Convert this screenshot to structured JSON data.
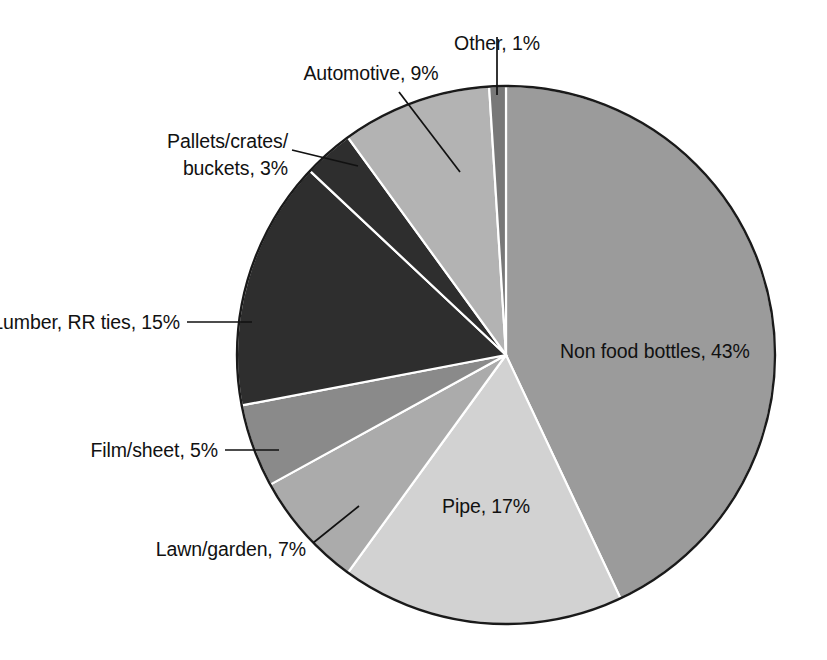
{
  "chart_data": {
    "type": "pie",
    "title": "",
    "subtitle": "",
    "xlabel": "",
    "ylabel": "",
    "units": "percent",
    "total": 100,
    "legend_position": "none",
    "label_format": "{name}, {value}%",
    "grid": false,
    "start_angle_deg": -90,
    "direction": "clockwise",
    "categories": [
      "Non food bottles",
      "Pipe",
      "Lawn/garden",
      "Film/sheet",
      "Lumber, RR ties",
      "Pallets/crates/buckets",
      "Automotive",
      "Other"
    ],
    "values": [
      43,
      17,
      7,
      5,
      15,
      3,
      9,
      1
    ],
    "colors": [
      "#9b9b9b",
      "#d2d2d2",
      "#ababab",
      "#8a8a8a",
      "#2e2e2e",
      "#2e2e2e",
      "#b3b3b3",
      "#787878"
    ],
    "slices": [
      {
        "name": "Non food bottles",
        "value": 43,
        "label": "Non food bottles, 43%",
        "color": "#9b9b9b",
        "label_placement": "inside"
      },
      {
        "name": "Pipe",
        "value": 17,
        "label": "Pipe, 17%",
        "color": "#d2d2d2",
        "label_placement": "inside"
      },
      {
        "name": "Lawn/garden",
        "value": 7,
        "label": "Lawn/garden, 7%",
        "color": "#ababab",
        "label_placement": "outside-left"
      },
      {
        "name": "Film/sheet",
        "value": 5,
        "label": "Film/sheet, 5%",
        "color": "#8a8a8a",
        "label_placement": "outside-left"
      },
      {
        "name": "Lumber, RR ties",
        "value": 15,
        "label": "Lumber, RR ties, 15%",
        "color": "#2e2e2e",
        "label_placement": "outside-left"
      },
      {
        "name": "Pallets/crates/buckets",
        "value": 3,
        "label": "Pallets/crates/\nbuckets, 3%",
        "label_line1": "Pallets/crates/",
        "label_line2": "buckets, 3%",
        "color": "#2e2e2e",
        "label_placement": "outside-left"
      },
      {
        "name": "Automotive",
        "value": 9,
        "label": "Automotive, 9%",
        "color": "#b3b3b3",
        "label_placement": "outside-top"
      },
      {
        "name": "Other",
        "value": 1,
        "label": "Other, 1%",
        "color": "#787878",
        "label_placement": "outside-top"
      }
    ]
  },
  "labels": {
    "other": "Other, 1%",
    "automotive": "Automotive, 9%",
    "pallets_line1": "Pallets/crates/",
    "pallets_line2": "buckets, 3%",
    "lumber": "Lumber, RR ties, 15%",
    "film_sheet": "Film/sheet, 5%",
    "lawn_garden": "Lawn/garden, 7%",
    "pipe": "Pipe, 17%",
    "non_food_bottles": "Non food bottles, 43%"
  },
  "style": {
    "background": "#ffffff",
    "outline_color": "#1a1a1a",
    "text_color": "#111111",
    "slice_border_color": "#ffffff"
  }
}
